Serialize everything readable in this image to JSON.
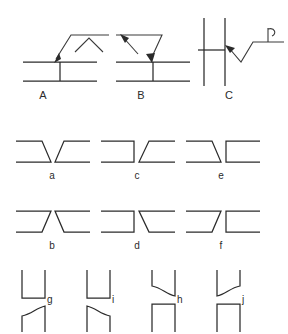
{
  "figure": {
    "background_color": "#ffffff",
    "line_color": "#2b2b2b",
    "width": 288,
    "height": 334
  },
  "rows": {
    "top": {
      "name": "arrow-callout-row",
      "panels": [
        {
          "id": "A",
          "label": "A",
          "description": "T-joint with arrow pointing down-left to joint from upper right leader line with chevron mark"
        },
        {
          "id": "B",
          "label": "B",
          "description": "T-joint with arrow pointing down-right to joint from upper left leader line with up arrowhead"
        },
        {
          "id": "C",
          "label": "C",
          "description": "Two vertical members with horizontal member, zigzag arrow pointing up-left to joint, tail flag at right"
        }
      ]
    },
    "middle_upper": {
      "name": "downward-bevel-row",
      "panels": [
        {
          "id": "a",
          "label": "a",
          "description": "Double bevel V groove opening downward"
        },
        {
          "id": "c",
          "label": "c",
          "description": "Single bevel groove, right member beveled, opening downward"
        },
        {
          "id": "e",
          "label": "e",
          "description": "Single bevel groove, left member beveled, opening downward"
        }
      ]
    },
    "middle_lower": {
      "name": "upward-bevel-row",
      "panels": [
        {
          "id": "b",
          "label": "b",
          "description": "Double bevel V groove opening upward"
        },
        {
          "id": "d",
          "label": "d",
          "description": "Single bevel groove, right member beveled, opening upward"
        },
        {
          "id": "f",
          "label": "f",
          "description": "Single bevel groove, left member beveled, opening upward"
        }
      ]
    },
    "bottom": {
      "name": "j-groove-row",
      "panels": [
        {
          "id": "g",
          "label": "g",
          "description": "J groove, lower member left side curved, upper member square"
        },
        {
          "id": "i",
          "label": "i",
          "description": "J groove, lower member right side curved, upper member square"
        },
        {
          "id": "h",
          "label": "h",
          "description": "J groove, upper member left side curved, lower member square"
        },
        {
          "id": "j",
          "label": "j",
          "description": "J groove, upper member right side curved, lower member square"
        }
      ]
    }
  }
}
